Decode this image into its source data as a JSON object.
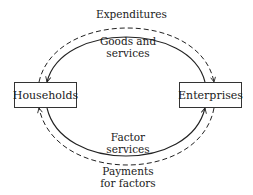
{
  "nodes": {
    "households": "Households",
    "enterprises": "Enterprises"
  },
  "flows": {
    "expenditures": "Expenditures",
    "goods_line1": "Goods and",
    "goods_line2": "services",
    "factor_line1": "Factor",
    "factor_line2": "services",
    "payments_line1": "Payments",
    "payments_line2": "for factors"
  },
  "colors": {
    "line": "#222222",
    "box_border": "#333333"
  }
}
